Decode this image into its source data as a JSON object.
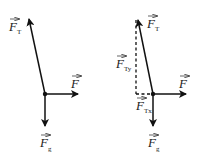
{
  "diagrams": [
    {
      "id": "left",
      "origin": {
        "x": 45,
        "y": 94
      },
      "forces": [
        {
          "name": "tension",
          "symbol": "F",
          "subscript": "T",
          "tip": {
            "x": 28,
            "y": 15
          },
          "label_pos": {
            "x": 8,
            "y": 30
          }
        },
        {
          "name": "applied",
          "symbol": "F",
          "subscript": "",
          "tip": {
            "x": 80,
            "y": 94
          },
          "label_pos": {
            "x": 70,
            "y": 86
          }
        },
        {
          "name": "gravity",
          "symbol": "F",
          "subscript": "g",
          "tip": {
            "x": 45,
            "y": 128
          },
          "label_pos": {
            "x": 40,
            "y": 148
          }
        }
      ]
    },
    {
      "id": "right",
      "origin": {
        "x": 153,
        "y": 94
      },
      "forces": [
        {
          "name": "tension",
          "symbol": "F",
          "subscript": "T",
          "tip": {
            "x": 137,
            "y": 16
          },
          "label_pos": {
            "x": 146,
            "y": 28
          }
        },
        {
          "name": "applied",
          "symbol": "F",
          "subscript": "",
          "tip": {
            "x": 188,
            "y": 94
          },
          "label_pos": {
            "x": 178,
            "y": 86
          }
        },
        {
          "name": "gravity",
          "symbol": "F",
          "subscript": "g",
          "tip": {
            "x": 153,
            "y": 128
          },
          "label_pos": {
            "x": 148,
            "y": 148
          }
        }
      ],
      "components": [
        {
          "name": "tension-y",
          "symbol": "F",
          "subscript": "Ty",
          "label_pos": {
            "x": 116,
            "y": 69
          }
        },
        {
          "name": "tension-x",
          "symbol": "F",
          "subscript": "Tx",
          "label_pos": {
            "x": 136,
            "y": 111
          }
        }
      ]
    }
  ],
  "labels": {
    "left_ft": "F",
    "left_ft_sub": "T",
    "left_f": "F",
    "left_fg": "F",
    "left_fg_sub": "g",
    "right_ft": "F",
    "right_ft_sub": "T",
    "right_f": "F",
    "right_fg": "F",
    "right_fg_sub": "g",
    "right_fty": "F",
    "right_fty_sub": "Ty",
    "right_ftx": "F",
    "right_ftx_sub": "Tx"
  },
  "colors": {
    "stroke": "#111111",
    "text": "#222222",
    "background": "#ffffff"
  }
}
